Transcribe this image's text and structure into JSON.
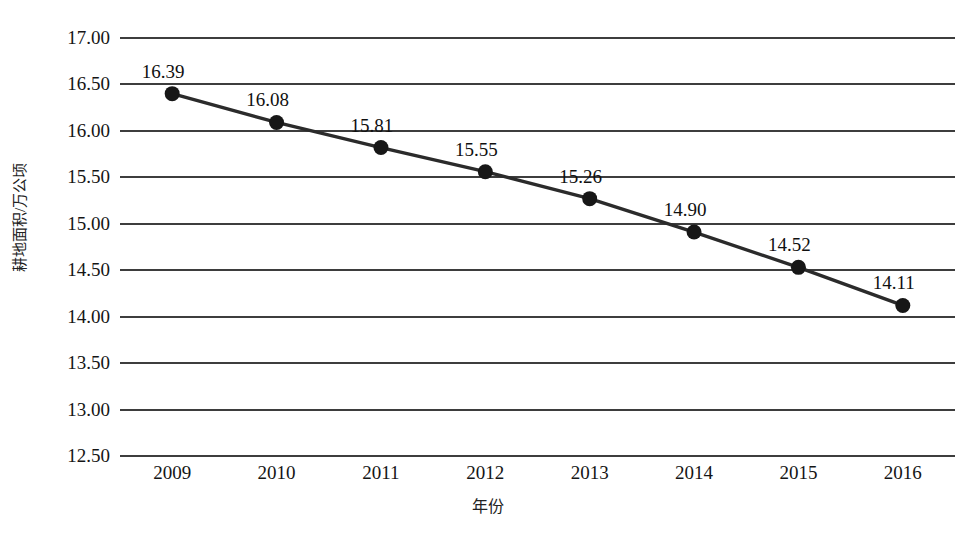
{
  "chart_data": {
    "type": "line",
    "title": "",
    "xlabel": "年份",
    "ylabel": "耕地面积/万公顷",
    "categories": [
      "2009",
      "2010",
      "2011",
      "2012",
      "2013",
      "2014",
      "2015",
      "2016"
    ],
    "values": [
      16.39,
      16.08,
      15.81,
      15.55,
      15.26,
      14.9,
      14.52,
      14.11
    ],
    "point_labels": [
      "16.39",
      "16.08",
      "15.81",
      "15.55",
      "15.26",
      "14.90",
      "14.52",
      "14.11"
    ],
    "ylim": [
      12.5,
      17.0
    ],
    "ytick_step": 0.5,
    "ytick_labels": [
      "17.00",
      "16.50",
      "16.00",
      "15.50",
      "15.00",
      "14.50",
      "14.00",
      "13.50",
      "13.00",
      "12.50"
    ],
    "ytick_values": [
      17.0,
      16.5,
      16.0,
      15.5,
      15.0,
      14.5,
      14.0,
      13.5,
      13.0,
      12.5
    ],
    "grid": "horizontal",
    "legend": "none",
    "series": [
      {
        "name": "耕地面积",
        "values": [
          16.39,
          16.08,
          15.81,
          15.55,
          15.26,
          14.9,
          14.52,
          14.11
        ]
      }
    ],
    "colors": {
      "line": "#2b2b2b",
      "marker": "#171717",
      "gridline": "#3d3d3d",
      "background": "#ffffff"
    }
  }
}
